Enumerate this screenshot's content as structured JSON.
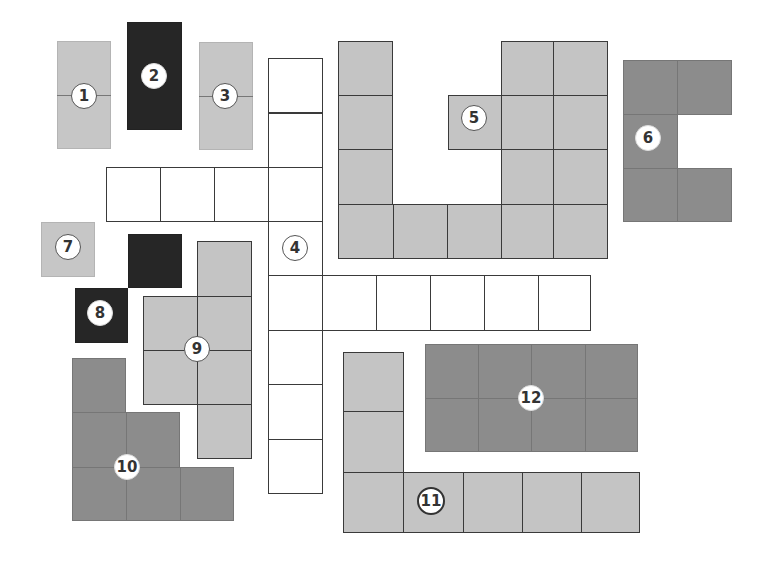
{
  "colors": {
    "light_gray": "#c4c4c4",
    "mid_gray": "#8c8c8c",
    "black": "#262626",
    "white": "#ffffff",
    "outline": "#3a3a3a"
  },
  "pieces": [
    {
      "label": "1",
      "color": "light_gray",
      "cells": 2
    },
    {
      "label": "2",
      "color": "black",
      "cells": 2
    },
    {
      "label": "3",
      "color": "light_gray",
      "cells": 2
    },
    {
      "label": "4",
      "color": "white",
      "cells": 16
    },
    {
      "label": "5",
      "color": "light_gray",
      "cells": 15
    },
    {
      "label": "6",
      "color": "mid_gray",
      "cells": 5
    },
    {
      "label": "7",
      "color": "light_gray",
      "cells": 1
    },
    {
      "label": "8",
      "color": "black",
      "cells": 2
    },
    {
      "label": "9",
      "color": "light_gray",
      "cells": 6
    },
    {
      "label": "10",
      "color": "mid_gray",
      "cells": 6
    },
    {
      "label": "11",
      "color": "light_gray",
      "cells": 7
    },
    {
      "label": "12",
      "color": "mid_gray",
      "cells": 8
    }
  ]
}
